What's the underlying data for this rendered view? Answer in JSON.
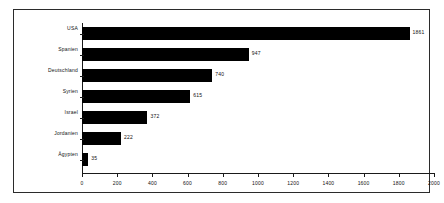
{
  "chart_data": {
    "type": "bar",
    "orientation": "horizontal",
    "title": "",
    "subtitle": "",
    "xlabel": "",
    "ylabel": "",
    "categories": [
      "USA",
      "Spanien",
      "Deutschland",
      "Syrien",
      "Israel",
      "Jordanien",
      "Ägypten"
    ],
    "values": [
      1861,
      947,
      740,
      615,
      372,
      222,
      35
    ],
    "data_labels": [
      "1861",
      "947",
      "740",
      "615",
      "372",
      "222",
      "35"
    ],
    "xlim": [
      0,
      2000
    ],
    "xticks": [
      0,
      200,
      400,
      600,
      800,
      1000,
      1200,
      1400,
      1600,
      1800,
      2000
    ],
    "xtick_labels": [
      "0",
      "200",
      "400",
      "600",
      "800",
      "1000",
      "1200",
      "1400",
      "1600",
      "1800",
      "2000"
    ],
    "grid": false,
    "legend": false,
    "bar_color": "#000000",
    "axis_color": "#1a1a1a",
    "background_color": "#ffffff",
    "frame": true
  }
}
